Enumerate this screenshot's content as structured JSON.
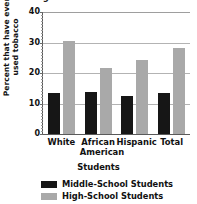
{
  "chart_data": {
    "type": "bar",
    "title": "Percentage of Students Who Have Ever Used Tobacco",
    "xlabel": "Students",
    "ylabel": "Percent that have ever used tobacco",
    "categories": [
      "White",
      "African American",
      "Hispanic",
      "Total"
    ],
    "series": [
      {
        "name": "Middle-School Students",
        "color": "#161616",
        "values": [
          13.3,
          13.7,
          12.5,
          13.4
        ]
      },
      {
        "name": "High-School Students",
        "color": "#a9a9a9",
        "values": [
          30.5,
          21.5,
          24.4,
          28.2
        ]
      }
    ],
    "ylim": [
      0,
      40
    ],
    "yticks": [
      0,
      10,
      20,
      30,
      40
    ],
    "ytick_labels": [
      "0",
      "10",
      "20",
      "30",
      "40"
    ],
    "grid": true,
    "legend_position": "below"
  },
  "axes": {
    "y": {
      "ticks": [
        {
          "value": 40,
          "label": "40"
        },
        {
          "value": 30,
          "label": "30"
        },
        {
          "value": 20,
          "label": "20"
        },
        {
          "value": 10,
          "label": "10"
        },
        {
          "value": 0,
          "label": "0"
        }
      ]
    },
    "x": {
      "ticks": [
        {
          "line1": "White",
          "line2": ""
        },
        {
          "line1": "African",
          "line2": "American"
        },
        {
          "line1": "Hispanic",
          "line2": ""
        },
        {
          "line1": "Total",
          "line2": ""
        }
      ]
    }
  },
  "legend": {
    "entries": [
      {
        "label": "Middle-School Students",
        "color": "#161616"
      },
      {
        "label": "High-School Students",
        "color": "#a9a9a9"
      }
    ]
  }
}
